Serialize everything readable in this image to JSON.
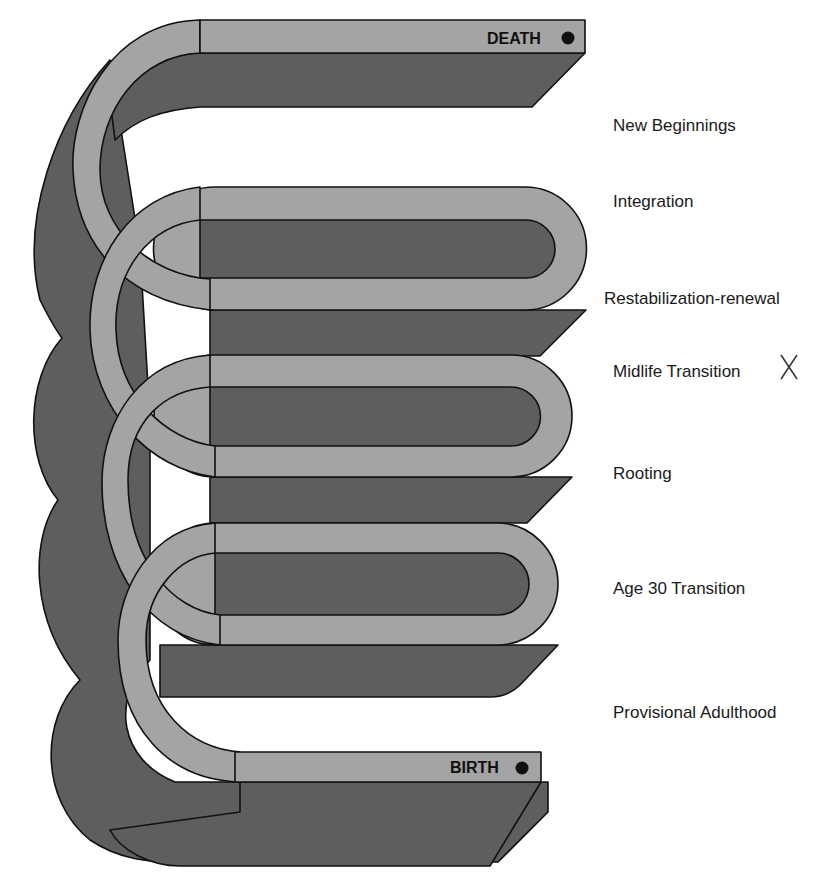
{
  "diagram": {
    "colors": {
      "band_light": "#a4a4a4",
      "band_dark": "#5e5e5e",
      "outline": "#111111",
      "background": "#ffffff"
    },
    "end_labels": {
      "death": "DEATH",
      "birth": "BIRTH"
    },
    "stages": [
      {
        "label": "New Beginnings",
        "y": 126
      },
      {
        "label": "Integration",
        "y": 202
      },
      {
        "label": "Restabilization-renewal",
        "y": 299
      },
      {
        "label": "Midlife Transition",
        "y": 372,
        "marker": "X"
      },
      {
        "label": "Rooting",
        "y": 474
      },
      {
        "label": "Age 30 Transition",
        "y": 589
      },
      {
        "label": "Provisional Adulthood",
        "y": 713
      }
    ]
  }
}
